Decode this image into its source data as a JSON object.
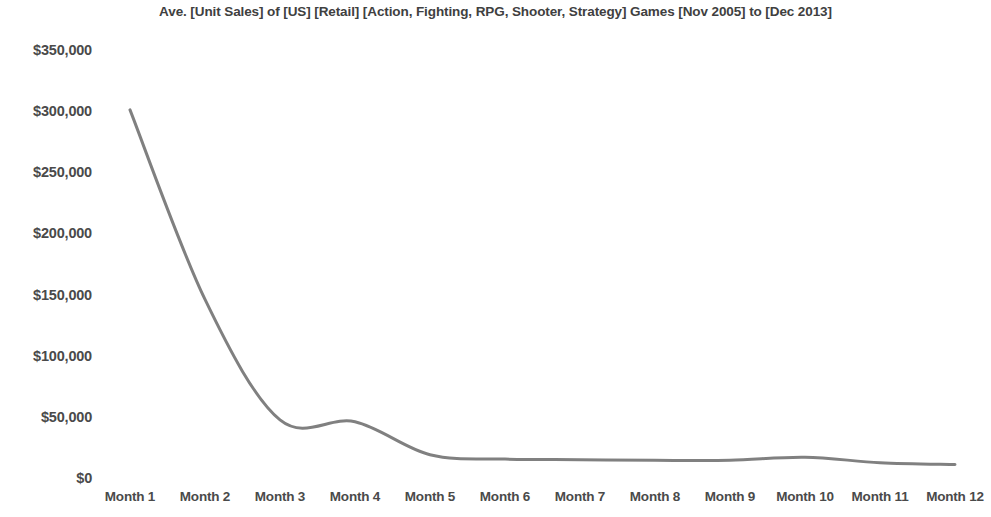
{
  "chart_data": {
    "type": "line",
    "title": "Ave. [Unit Sales] of [US] [Retail] [Action, Fighting, RPG, Shooter, Strategy] Games [Nov 2005] to [Dec 2013]",
    "xlabel": "",
    "ylabel": "",
    "categories": [
      "Month 1",
      "Month 2",
      "Month 3",
      "Month 4",
      "Month 5",
      "Month 6",
      "Month 7",
      "Month 8",
      "Month 9",
      "Month 10",
      "Month 11",
      "Month 12"
    ],
    "values": [
      301000,
      146000,
      47500,
      46000,
      19000,
      15500,
      15000,
      14500,
      14500,
      17000,
      12500,
      11000
    ],
    "series": [
      {
        "name": "Ave. Unit Sales",
        "values": [
          301000,
          146000,
          47500,
          46000,
          19000,
          15500,
          15000,
          14500,
          14500,
          17000,
          12500,
          11000
        ],
        "color": "#808080"
      }
    ],
    "ylim": [
      0,
      350000
    ],
    "ytick_values": [
      0,
      50000,
      100000,
      150000,
      200000,
      250000,
      300000,
      350000
    ],
    "ytick_labels": [
      "$0",
      "$50,000",
      "$100,000",
      "$150,000",
      "$200,000",
      "$250,000",
      "$300,000",
      "$350,000"
    ],
    "grid": false,
    "legend": "none",
    "smooth": true,
    "markers": false,
    "line_width": 3,
    "background_color": "#ffffff",
    "text_color": "#4a4a4a"
  }
}
